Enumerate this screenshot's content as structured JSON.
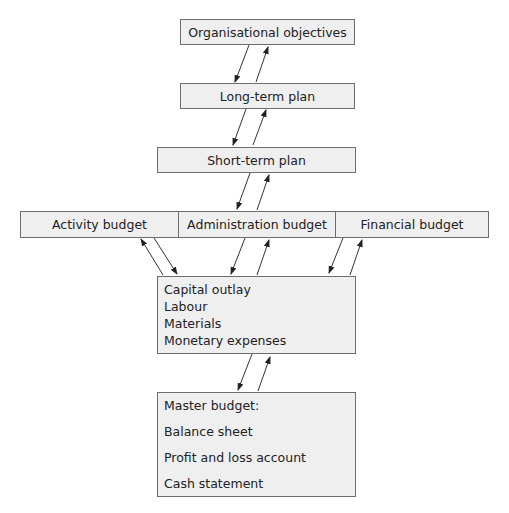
{
  "diagram": {
    "nodes": {
      "objectives": "Organisational objectives",
      "long_term": "Long-term plan",
      "short_term": "Short-term plan",
      "budgets": [
        "Activity budget",
        "Administration budget",
        "Financial budget"
      ],
      "components": [
        "Capital outlay",
        "Labour",
        "Materials",
        "Monetary expenses"
      ],
      "master": [
        "Master budget:",
        "Balance sheet",
        "Profit and loss account",
        "Cash statement"
      ]
    },
    "edges": [
      {
        "from": "Organisational objectives",
        "to": "Long-term plan",
        "direction": "bidirectional"
      },
      {
        "from": "Long-term plan",
        "to": "Short-term plan",
        "direction": "bidirectional"
      },
      {
        "from": "Short-term plan",
        "to": "Administration budget",
        "direction": "bidirectional"
      },
      {
        "from": "Activity budget",
        "to": "Components",
        "direction": "bidirectional"
      },
      {
        "from": "Administration budget",
        "to": "Components",
        "direction": "bidirectional"
      },
      {
        "from": "Financial budget",
        "to": "Components",
        "direction": "bidirectional"
      },
      {
        "from": "Components",
        "to": "Master budget",
        "direction": "bidirectional"
      }
    ],
    "colors": {
      "box_fill": "#efefef",
      "box_border": "#6d6d6d",
      "arrow": "#222222"
    }
  }
}
